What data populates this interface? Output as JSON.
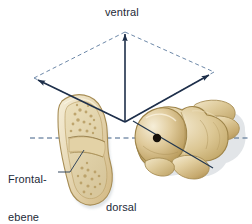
{
  "figure": {
    "name": "anatomical-orientation-diagram",
    "background_color": "#dde9f3",
    "border_color": "#ffffff"
  },
  "labels": {
    "ventral": "ventral",
    "dorsal": "dorsal",
    "frontal_plane_line1": "Frontal-",
    "frontal_plane_line2": "ebene"
  },
  "colors": {
    "line": "#1e2f4a",
    "dash": "#4a6a90",
    "text": "#1d2a38",
    "bone_light": "#efe3c2",
    "bone_mid": "#d8c291",
    "bone_dark": "#b99c60",
    "bone_shadow": "#8f7740",
    "marrow": "#e6d9b4",
    "dot": "#1a1208"
  },
  "geometry": {
    "plane_apex_top": [
      125,
      32
    ],
    "plane_vertex_left": [
      34,
      78
    ],
    "plane_vertex_right": [
      214,
      72
    ],
    "plane_vertex_bottom": [
      125,
      122
    ],
    "center_dot": [
      157,
      138
    ],
    "dot_radius": 4,
    "vertical_arrow": {
      "from": [
        125,
        122
      ],
      "to": [
        125,
        29
      ]
    },
    "left_arrow": {
      "from": [
        125,
        122
      ],
      "to": [
        34,
        78
      ]
    },
    "right_arrow": {
      "from": [
        125,
        122
      ],
      "to": [
        212,
        73
      ]
    },
    "frontal_dashed_line": {
      "from": [
        30,
        138
      ],
      "to": [
        250,
        138
      ]
    },
    "oblique_axis_line": {
      "from": [
        133,
        121
      ],
      "to": [
        213,
        168
      ]
    },
    "leader_line": [
      [
        58,
        172
      ],
      [
        70,
        172
      ],
      [
        84,
        150
      ]
    ]
  },
  "elements": {
    "sectioned_bone": "talus-sagittal-section",
    "whole_bone": "talus-three-dimensional",
    "center_marker": "rotation-axis-point",
    "plane_outline": "frontal-plane-parallelogram"
  }
}
